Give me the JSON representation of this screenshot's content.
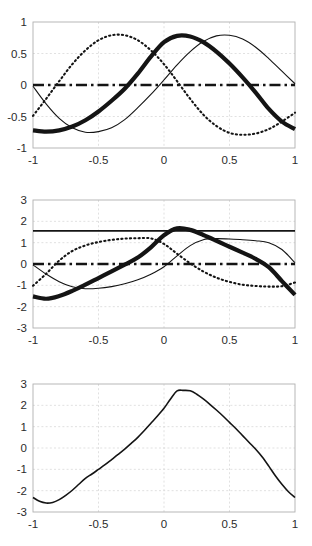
{
  "figure": {
    "type": "multi-panel-line-plot",
    "background": "#ffffff",
    "panel_count": 3,
    "axis_color": "#b0b0b0",
    "grid_color": "#d9d9d9",
    "curve_color": "#141414",
    "tick_label_color": "#2b2b2b"
  },
  "chart_data": [
    {
      "id": "panel-1",
      "type": "line",
      "title": "",
      "subtitle": "",
      "xlabel": "",
      "ylabel": "",
      "xlim": [
        -1,
        1
      ],
      "ylim": [
        -1,
        1
      ],
      "xticks": [
        -1,
        -0.5,
        0,
        0.5,
        1
      ],
      "xtick_labels": [
        "-1",
        "-0.5",
        "0",
        "0.5",
        "1"
      ],
      "yticks": [
        -1,
        -0.5,
        0,
        0.5,
        1
      ],
      "ytick_labels": [
        "-1",
        "-0.5",
        "0",
        "0.5",
        "1"
      ],
      "grid": true,
      "legend": "none",
      "annotations": [],
      "series": [
        {
          "name": "thin-solid-cosine",
          "style": "solid",
          "width": 1.1,
          "color": "#141414",
          "x": [
            -1,
            -0.9,
            -0.8,
            -0.7,
            -0.6,
            -0.5,
            -0.4,
            -0.3,
            -0.2,
            -0.1,
            0,
            0.1,
            0.2,
            0.3,
            0.4,
            0.5,
            0.6,
            0.7,
            0.8,
            0.9,
            1
          ],
          "values": [
            -0.02,
            -0.3,
            -0.53,
            -0.68,
            -0.75,
            -0.74,
            -0.68,
            -0.55,
            -0.36,
            -0.15,
            0.08,
            0.32,
            0.53,
            0.69,
            0.78,
            0.79,
            0.73,
            0.6,
            0.42,
            0.22,
            0.02
          ]
        },
        {
          "name": "dotted-cosine",
          "style": "dotted",
          "width": 2.1,
          "color": "#141414",
          "x": [
            -1,
            -0.9,
            -0.8,
            -0.7,
            -0.6,
            -0.5,
            -0.4,
            -0.3,
            -0.2,
            -0.1,
            0,
            0.1,
            0.2,
            0.3,
            0.4,
            0.5,
            0.6,
            0.7,
            0.8,
            0.9,
            1
          ],
          "values": [
            -0.49,
            -0.22,
            0.06,
            0.33,
            0.55,
            0.71,
            0.79,
            0.79,
            0.71,
            0.55,
            0.33,
            0.06,
            -0.22,
            -0.47,
            -0.65,
            -0.76,
            -0.79,
            -0.77,
            -0.7,
            -0.58,
            -0.44
          ]
        },
        {
          "name": "thick-solid-sine",
          "style": "solid",
          "width": 4.2,
          "color": "#141414",
          "x": [
            -1,
            -0.9,
            -0.8,
            -0.7,
            -0.6,
            -0.5,
            -0.4,
            -0.3,
            -0.2,
            -0.1,
            0,
            0.1,
            0.2,
            0.3,
            0.4,
            0.5,
            0.6,
            0.7,
            0.8,
            0.9,
            1
          ],
          "values": [
            -0.72,
            -0.74,
            -0.72,
            -0.66,
            -0.56,
            -0.42,
            -0.25,
            -0.06,
            0.18,
            0.45,
            0.68,
            0.78,
            0.77,
            0.68,
            0.53,
            0.34,
            0.12,
            -0.12,
            -0.38,
            -0.58,
            -0.7
          ]
        },
        {
          "name": "dashdot-zero-line",
          "style": "dashdot",
          "width": 2.6,
          "color": "#141414",
          "x": [
            -1,
            1
          ],
          "values": [
            0,
            0
          ]
        }
      ]
    },
    {
      "id": "panel-2",
      "type": "line",
      "title": "",
      "subtitle": "",
      "xlabel": "",
      "ylabel": "",
      "xlim": [
        -1,
        1
      ],
      "ylim": [
        -3,
        3
      ],
      "xticks": [
        -1,
        -0.5,
        0,
        0.5,
        1
      ],
      "xtick_labels": [
        "-1",
        "-0.5",
        "0",
        "0.5",
        "1"
      ],
      "yticks": [
        -3,
        -2,
        -1,
        0,
        1,
        2,
        3
      ],
      "ytick_labels": [
        "-3",
        "-2",
        "-1",
        "0",
        "1",
        "2",
        "3"
      ],
      "grid": true,
      "legend": "none",
      "annotations": [],
      "series": [
        {
          "name": "solid-horizontal-level",
          "style": "solid",
          "width": 1.8,
          "color": "#141414",
          "x": [
            -1,
            1
          ],
          "values": [
            1.55,
            1.55
          ]
        },
        {
          "name": "dashdot-zero-line",
          "style": "dashdot",
          "width": 2.6,
          "color": "#141414",
          "x": [
            -1,
            1
          ],
          "values": [
            0,
            0
          ]
        },
        {
          "name": "thin-solid-cosine",
          "style": "solid",
          "width": 1.1,
          "color": "#141414",
          "x": [
            -1,
            -0.9,
            -0.8,
            -0.7,
            -0.6,
            -0.5,
            -0.4,
            -0.3,
            -0.2,
            -0.1,
            0,
            0.1,
            0.2,
            0.3,
            0.4,
            0.5,
            0.6,
            0.7,
            0.8,
            0.9,
            1
          ],
          "values": [
            -0.04,
            -0.47,
            -0.83,
            -1.07,
            -1.16,
            -1.14,
            -1.06,
            -0.93,
            -0.74,
            -0.48,
            -0.13,
            0.38,
            0.86,
            1.14,
            1.19,
            1.17,
            1.14,
            1.09,
            1.0,
            0.68,
            0.06
          ]
        },
        {
          "name": "dotted-cosine",
          "style": "dotted",
          "width": 2.1,
          "color": "#141414",
          "x": [
            -1,
            -0.9,
            -0.8,
            -0.7,
            -0.6,
            -0.5,
            -0.4,
            -0.3,
            -0.2,
            -0.1,
            0,
            0.1,
            0.2,
            0.3,
            0.4,
            0.5,
            0.6,
            0.7,
            0.8,
            0.9,
            1
          ],
          "values": [
            -1.02,
            -0.46,
            0.16,
            0.61,
            0.87,
            1.03,
            1.13,
            1.19,
            1.21,
            1.2,
            0.94,
            0.48,
            0.03,
            -0.35,
            -0.64,
            -0.84,
            -0.97,
            -1.03,
            -1.06,
            -1.04,
            -0.87
          ]
        },
        {
          "name": "thick-solid-sine",
          "style": "solid",
          "width": 4.2,
          "color": "#141414",
          "x": [
            -1,
            -0.9,
            -0.8,
            -0.7,
            -0.6,
            -0.5,
            -0.4,
            -0.3,
            -0.2,
            -0.1,
            0,
            0.1,
            0.2,
            0.3,
            0.4,
            0.5,
            0.6,
            0.7,
            0.8,
            0.9,
            1
          ],
          "values": [
            -1.52,
            -1.63,
            -1.5,
            -1.26,
            -0.97,
            -0.66,
            -0.35,
            -0.03,
            0.3,
            0.78,
            1.35,
            1.67,
            1.6,
            1.36,
            1.09,
            0.81,
            0.53,
            0.24,
            -0.15,
            -0.8,
            -1.45
          ]
        }
      ]
    },
    {
      "id": "panel-3",
      "type": "line",
      "title": "",
      "subtitle": "",
      "xlabel": "",
      "ylabel": "",
      "xlim": [
        -1,
        1
      ],
      "ylim": [
        -3,
        3
      ],
      "xticks": [
        -1,
        -0.5,
        0,
        0.5,
        1
      ],
      "xtick_labels": [
        "-1",
        "-0.5",
        "0",
        "0.5",
        "1"
      ],
      "yticks": [
        -3,
        -2,
        -1,
        0,
        1,
        2,
        3
      ],
      "ytick_labels": [
        "-3",
        "-2",
        "-1",
        "0",
        "1",
        "2",
        "3"
      ],
      "grid": true,
      "legend": "none",
      "annotations": [],
      "series": [
        {
          "name": "sum-curve",
          "style": "solid",
          "width": 1.6,
          "color": "#141414",
          "x": [
            -1,
            -0.95,
            -0.9,
            -0.85,
            -0.8,
            -0.75,
            -0.7,
            -0.65,
            -0.6,
            -0.55,
            -0.5,
            -0.45,
            -0.4,
            -0.35,
            -0.3,
            -0.25,
            -0.2,
            -0.15,
            -0.1,
            -0.05,
            0,
            0.05,
            0.1,
            0.15,
            0.2,
            0.25,
            0.3,
            0.35,
            0.4,
            0.45,
            0.5,
            0.55,
            0.6,
            0.65,
            0.7,
            0.75,
            0.8,
            0.85,
            0.9,
            0.95,
            1
          ],
          "values": [
            -2.32,
            -2.5,
            -2.58,
            -2.55,
            -2.42,
            -2.22,
            -1.98,
            -1.7,
            -1.42,
            -1.22,
            -1.0,
            -0.78,
            -0.54,
            -0.3,
            -0.05,
            0.22,
            0.5,
            0.82,
            1.16,
            1.5,
            1.86,
            2.3,
            2.68,
            2.7,
            2.68,
            2.52,
            2.3,
            2.05,
            1.78,
            1.5,
            1.2,
            0.9,
            0.58,
            0.26,
            -0.06,
            -0.42,
            -0.85,
            -1.3,
            -1.7,
            -2.05,
            -2.32
          ]
        }
      ]
    }
  ]
}
